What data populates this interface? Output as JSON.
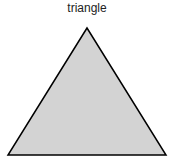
{
  "diagram": {
    "title": "triangle",
    "shape": {
      "type": "triangle",
      "points": [
        [
          87,
          28
        ],
        [
          8,
          155
        ],
        [
          166,
          155
        ]
      ],
      "fill": "#d3d3d3",
      "stroke": "#000000"
    }
  }
}
